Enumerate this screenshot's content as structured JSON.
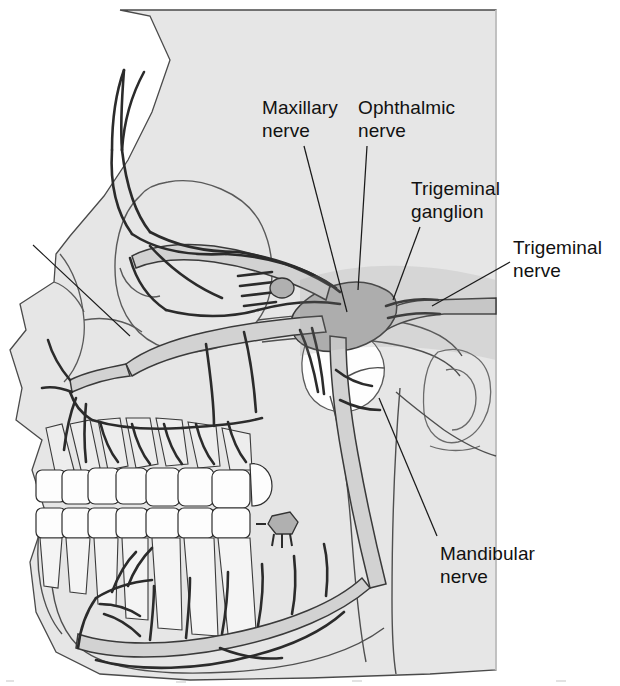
{
  "figure": {
    "type": "anatomical-illustration",
    "background_color": "#ffffff",
    "bone_fill_color": "#e6e6e6",
    "bone_outline_color": "#4a4a4a",
    "nerve_fill_color": "#d2d2d2",
    "nerve_outline_color": "#3a3a3a",
    "ganglion_fill_color": "#b4b4b4",
    "tooth_fill_color": "#fdfdfd",
    "label_color": "#111111",
    "leader_color": "#1a1a1a"
  },
  "labels": [
    {
      "id": "maxillary-nerve",
      "lines": [
        "Maxillary",
        "nerve"
      ],
      "text_x": 262,
      "text_y": 96,
      "leader": {
        "x1": 304,
        "y1": 146,
        "x2": 347,
        "y2": 312
      }
    },
    {
      "id": "ophthalmic-nerve",
      "lines": [
        "Ophthalmic",
        "nerve"
      ],
      "text_x": 358,
      "text_y": 96,
      "leader": {
        "x1": 367,
        "y1": 146,
        "x2": 358,
        "y2": 290
      }
    },
    {
      "id": "trigeminal-ganglion",
      "lines": [
        "Trigeminal",
        "ganglion"
      ],
      "text_x": 411,
      "text_y": 177,
      "leader": {
        "x1": 420,
        "y1": 227,
        "x2": 393,
        "y2": 300
      }
    },
    {
      "id": "trigeminal-nerve",
      "lines": [
        "Trigeminal",
        "nerve"
      ],
      "text_x": 513,
      "text_y": 236,
      "leader": {
        "x1": 510,
        "y1": 262,
        "x2": 432,
        "y2": 306
      }
    },
    {
      "id": "mandibular-nerve",
      "lines": [
        "Mandibular",
        "nerve"
      ],
      "text_x": 440,
      "text_y": 542,
      "leader": {
        "x1": 437,
        "y1": 536,
        "x2": 379,
        "y2": 398
      }
    }
  ],
  "unlabeled_leader": {
    "x1": 33,
    "y1": 245,
    "x2": 130,
    "y2": 336
  },
  "structures": [
    "cranium",
    "orbit",
    "nasal-cavity",
    "maxilla",
    "mandible",
    "zygomatic-arch",
    "external-acoustic-meatus",
    "maxillary-teeth",
    "mandibular-teeth",
    "supraorbital-nerve",
    "supratrochlear-nerve",
    "infraorbital-nerve",
    "superior-alveolar-nerves",
    "pterygopalatine-ganglion",
    "inferior-alveolar-nerve",
    "mental-nerve",
    "lingual-nerve",
    "auriculotemporal-nerve"
  ]
}
